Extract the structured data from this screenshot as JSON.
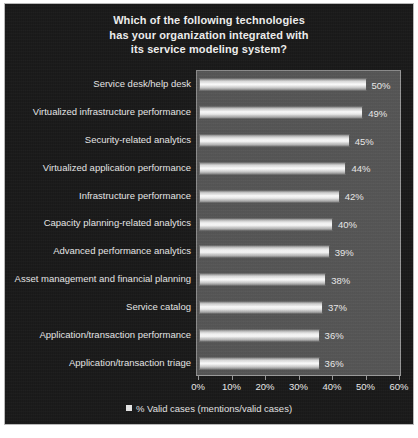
{
  "chart_data": {
    "type": "bar",
    "orientation": "horizontal",
    "title": "Which of the following technologies has your organization integrated with its service modeling system?",
    "title_lines": [
      "Which of the following technologies",
      "has your organization integrated with",
      "its service modeling system?"
    ],
    "categories": [
      "Service desk/help desk",
      "Virtualized infrastructure performance",
      "Security-related analytics",
      "Virtualized application performance",
      "Infrastructure performance",
      "Capacity planning-related analytics",
      "Advanced performance analytics",
      "Asset management and financial planning",
      "Service catalog",
      "Application/transaction performance",
      "Application/transaction triage"
    ],
    "values": [
      50,
      49,
      45,
      44,
      42,
      40,
      39,
      38,
      37,
      36,
      36
    ],
    "value_labels": [
      "50%",
      "49%",
      "45%",
      "44%",
      "42%",
      "40%",
      "39%",
      "38%",
      "37%",
      "36%",
      "36%"
    ],
    "xlabel": "",
    "ylabel": "",
    "xlim": [
      0,
      60
    ],
    "xtick_values": [
      0,
      10,
      20,
      30,
      40,
      50,
      60
    ],
    "xtick_labels": [
      "0%",
      "10%",
      "20%",
      "30%",
      "40%",
      "50%",
      "60%"
    ],
    "grid": false,
    "legend": {
      "position": "bottom",
      "entries": [
        {
          "label": "% Valid cases (mentions/valid cases)",
          "marker": "square",
          "color": "#e8e8e8"
        }
      ]
    },
    "colors": {
      "figure_background": "#191919",
      "plot_background": "#565656",
      "bar_fill": "#ffffff",
      "text": "#eaeaea",
      "border": "#b9b9b9"
    }
  }
}
